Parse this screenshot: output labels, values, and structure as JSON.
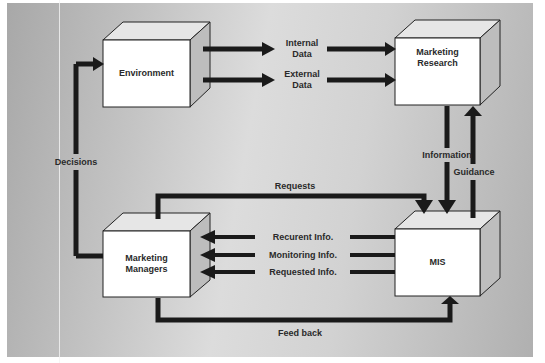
{
  "diagram": {
    "title": "",
    "nodes": {
      "environment": {
        "label": "Environment"
      },
      "marketing_research": {
        "line1": "Marketing",
        "line2": "Research"
      },
      "marketing_managers": {
        "line1": "Marketing",
        "line2": "Managers"
      },
      "mis": {
        "label": "MIS"
      }
    },
    "edges": {
      "internal_data": {
        "line1": "Internal",
        "line2": "Data"
      },
      "external_data": {
        "line1": "External",
        "line2": "Data"
      },
      "information": {
        "label": "Information"
      },
      "guidance": {
        "label": "Guidance"
      },
      "requests": {
        "label": "Requests"
      },
      "recurent_info": {
        "label": "Recurent Info."
      },
      "monitoring_info": {
        "label": "Monitoring Info."
      },
      "requested_info": {
        "label": "Requested Info."
      },
      "feed_back": {
        "label": "Feed back"
      },
      "decisions": {
        "label": "Decisions"
      }
    },
    "colors": {
      "background": "#c8c8c8",
      "box_front": "#ffffff",
      "box_top": "#e6e6e6",
      "box_side": "#bdbdbd",
      "line": "#1a1a1a",
      "text": "#2a2a2a"
    }
  }
}
